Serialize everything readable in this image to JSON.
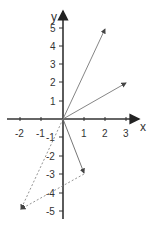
{
  "diagram": {
    "axes": {
      "x_label": "x",
      "y_label": "y",
      "x_ticks": [
        {
          "value": -2,
          "label": "-2"
        },
        {
          "value": -1,
          "label": "-1"
        },
        {
          "value": 1,
          "label": "1"
        },
        {
          "value": 2,
          "label": "2"
        },
        {
          "value": 3,
          "label": "3"
        }
      ],
      "y_ticks": [
        {
          "value": 5,
          "label": "5"
        },
        {
          "value": 4,
          "label": "4"
        },
        {
          "value": 3,
          "label": "3"
        },
        {
          "value": 2,
          "label": "2"
        },
        {
          "value": 1,
          "label": "1"
        },
        {
          "value": -1,
          "label": "-1"
        },
        {
          "value": -2,
          "label": "-2"
        },
        {
          "value": -3,
          "label": "-3"
        },
        {
          "value": -4,
          "label": "-4"
        },
        {
          "value": -5,
          "label": "-5"
        }
      ],
      "x_range": [
        -2.3,
        3.6
      ],
      "y_range": [
        -5.5,
        5.7
      ]
    },
    "vectors": [
      {
        "name": "vector-2-5",
        "from": [
          0,
          0
        ],
        "to": [
          2,
          5
        ],
        "style": "solid"
      },
      {
        "name": "vector-3-2",
        "from": [
          0,
          0
        ],
        "to": [
          3,
          2
        ],
        "style": "solid"
      },
      {
        "name": "vector-1-neg3",
        "from": [
          0,
          0
        ],
        "to": [
          1,
          -3
        ],
        "style": "solid"
      },
      {
        "name": "vector-neg2-neg5",
        "from": [
          0,
          0
        ],
        "to": [
          -2,
          -5
        ],
        "style": "dashed"
      },
      {
        "name": "vector-from-1-neg3-to-neg2-neg5",
        "from": [
          1,
          -3
        ],
        "to": [
          -2,
          -5
        ],
        "style": "dashed"
      }
    ],
    "colors": {
      "axis": "#333333",
      "vector": "#777777",
      "dashed": "#888888"
    }
  }
}
